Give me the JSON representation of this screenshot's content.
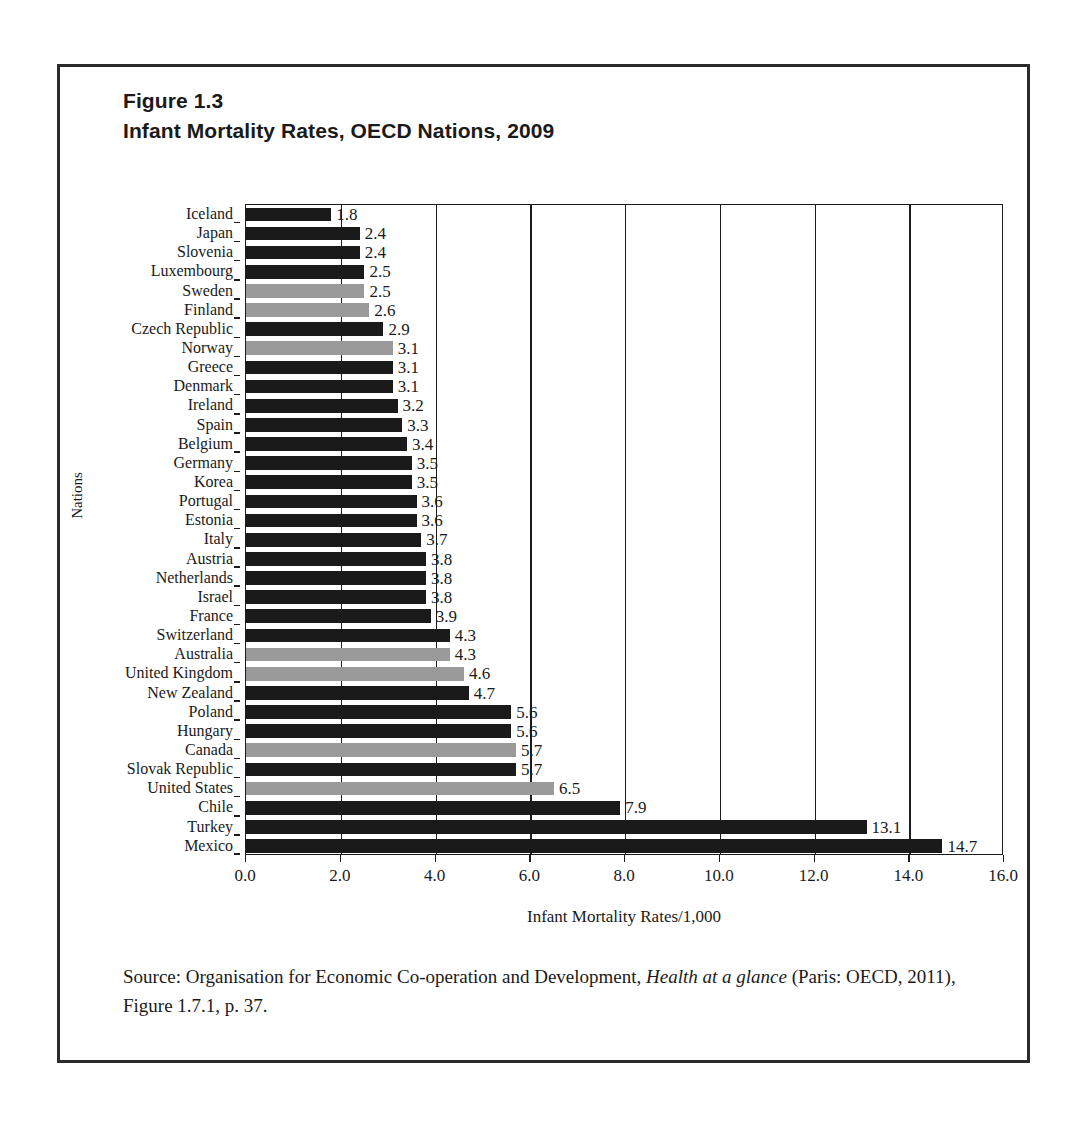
{
  "figure": {
    "title_line1": "Figure 1.3",
    "title_line2": "Infant Mortality Rates, OECD Nations, 2009",
    "source_prefix": "Source: Organisation for Economic Co-operation and Development, ",
    "source_italic": "Health at a glance",
    "source_suffix": " (Paris: OECD, 2011), Figure 1.7.1, p. 37."
  },
  "colors": {
    "bar_dark": "#1a1a1a",
    "bar_gray": "#9a9a9a",
    "axis": "#1c1c1c",
    "frame": "#2b2b2b",
    "text": "#1a1a1a"
  },
  "chart_data": {
    "type": "bar",
    "orientation": "horizontal",
    "title": "Infant Mortality Rates, OECD Nations, 2009",
    "xlabel": "Infant Mortality Rates/1,000",
    "ylabel": "Nations",
    "xlim": [
      0.0,
      16.0
    ],
    "xticks": [
      "0.0",
      "2.0",
      "4.0",
      "6.0",
      "8.0",
      "10.0",
      "12.0",
      "14.0",
      "16.0"
    ],
    "xtick_values": [
      0,
      2,
      4,
      6,
      8,
      10,
      12,
      14,
      16
    ],
    "grid": "vertical",
    "legend": "none",
    "categories": [
      "Iceland",
      "Japan",
      "Slovenia",
      "Luxembourg",
      "Sweden",
      "Finland",
      "Czech Republic",
      "Norway",
      "Greece",
      "Denmark",
      "Ireland",
      "Spain",
      "Belgium",
      "Germany",
      "Korea",
      "Portugal",
      "Estonia",
      "Italy",
      "Austria",
      "Netherlands",
      "Israel",
      "France",
      "Switzerland",
      "Australia",
      "United Kingdom",
      "New Zealand",
      "Poland",
      "Hungary",
      "Canada",
      "Slovak Republic",
      "United States",
      "Chile",
      "Turkey",
      "Mexico"
    ],
    "values": [
      1.8,
      2.4,
      2.4,
      2.5,
      2.5,
      2.6,
      2.9,
      3.1,
      3.1,
      3.1,
      3.2,
      3.3,
      3.4,
      3.5,
      3.5,
      3.6,
      3.6,
      3.7,
      3.8,
      3.8,
      3.8,
      3.9,
      4.3,
      4.3,
      4.6,
      4.7,
      5.6,
      5.6,
      5.7,
      5.7,
      6.5,
      7.9,
      13.1,
      14.7
    ],
    "value_labels": [
      "1.8",
      "2.4",
      "2.4",
      "2.5",
      "2.5",
      "2.6",
      "2.9",
      "3.1",
      "3.1",
      "3.1",
      "3.2",
      "3.3",
      "3.4",
      "3.5",
      "3.5",
      "3.6",
      "3.6",
      "3.7",
      "3.8",
      "3.8",
      "3.8",
      "3.9",
      "4.3",
      "4.3",
      "4.6",
      "4.7",
      "5.6",
      "5.6",
      "5.7",
      "5.7",
      "6.5",
      "7.9",
      "13.1",
      "14.7"
    ],
    "highlighted_gray": [
      "Sweden",
      "Finland",
      "Norway",
      "Australia",
      "United Kingdom",
      "Canada",
      "United States"
    ]
  }
}
